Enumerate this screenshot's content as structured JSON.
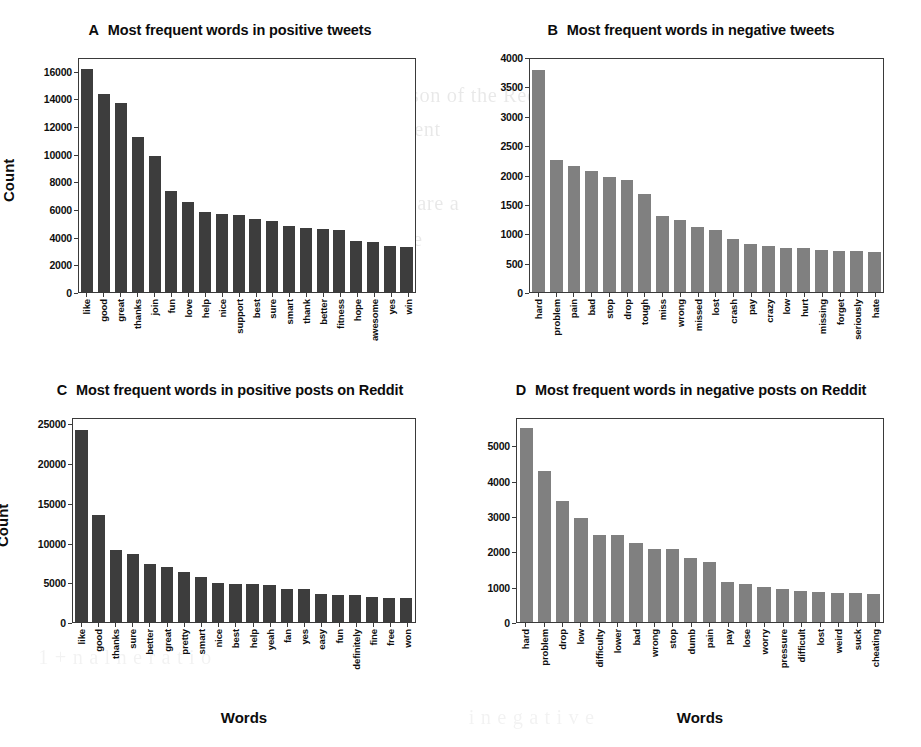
{
  "figure": {
    "ylabel": "Count",
    "xlabel": "Words",
    "bar_color_dark": "#3d3d3d",
    "bar_color_mid": "#808080",
    "axis_color": "#3a3a3a"
  },
  "bleed_lines": [
    "t  comparison of the  Reddit",
    "you lead to  a  very  different",
    "analysis  of  the  highest ranking",
    "on  the  Reddit  posts  are  a",
    "f  the  are  in  of  to  the"
  ],
  "chart_data": [
    {
      "panel": "A",
      "type": "bar",
      "letter": "A",
      "title": "Most frequent words in positive tweets",
      "xlabel": "",
      "ylabel": "Count",
      "ylim": [
        0,
        17000
      ],
      "yticks": [
        0,
        2000,
        4000,
        6000,
        8000,
        10000,
        12000,
        14000,
        16000
      ],
      "grid": false,
      "bar_color": "#3d3d3d",
      "categories": [
        "like",
        "good",
        "great",
        "thanks",
        "join",
        "fun",
        "love",
        "help",
        "nice",
        "support",
        "best",
        "sure",
        "smart",
        "thank",
        "better",
        "fitness",
        "hope",
        "awesome",
        "yes",
        "win"
      ],
      "values": [
        16300,
        14450,
        13800,
        11300,
        9900,
        7400,
        6600,
        5850,
        5700,
        5600,
        5300,
        5150,
        4850,
        4700,
        4600,
        4520,
        3750,
        3650,
        3350,
        3250
      ]
    },
    {
      "panel": "B",
      "type": "bar",
      "letter": "B",
      "title": "Most frequent words in negative tweets",
      "xlabel": "",
      "ylabel": "",
      "ylim": [
        0,
        4000
      ],
      "yticks": [
        0,
        500,
        1000,
        1500,
        2000,
        2500,
        3000,
        3500,
        4000
      ],
      "grid": false,
      "bar_color": "#808080",
      "categories": [
        "hard",
        "problem",
        "pain",
        "bad",
        "stop",
        "drop",
        "tough",
        "miss",
        "wrong",
        "missed",
        "lost",
        "crash",
        "pay",
        "crazy",
        "low",
        "hurt",
        "missing",
        "forget",
        "seriously",
        "hate"
      ],
      "values": [
        3820,
        2260,
        2170,
        2070,
        1980,
        1930,
        1690,
        1300,
        1230,
        1110,
        1060,
        910,
        820,
        790,
        760,
        750,
        720,
        710,
        700,
        690
      ]
    },
    {
      "panel": "C",
      "type": "bar",
      "letter": "C",
      "title": "Most frequent words in positive posts on Reddit",
      "xlabel": "Words",
      "ylabel": "Count",
      "ylim": [
        0,
        25800
      ],
      "yticks": [
        0,
        5000,
        10000,
        15000,
        20000,
        25000
      ],
      "grid": false,
      "bar_color": "#3d3d3d",
      "categories": [
        "like",
        "good",
        "thanks",
        "sure",
        "better",
        "great",
        "pretty",
        "smart",
        "nice",
        "best",
        "help",
        "yeah",
        "fan",
        "yes",
        "easy",
        "fun",
        "definitely",
        "fine",
        "free",
        "won"
      ],
      "values": [
        24400,
        13550,
        9150,
        8600,
        7350,
        6950,
        6400,
        5750,
        5000,
        4850,
        4800,
        4700,
        4250,
        4150,
        3550,
        3450,
        3400,
        3200,
        3100,
        3050
      ]
    },
    {
      "panel": "D",
      "type": "bar",
      "letter": "D",
      "title": "Most frequent words in negative posts on Reddit",
      "xlabel": "Words",
      "ylabel": "",
      "ylim": [
        0,
        5800
      ],
      "yticks": [
        0,
        1000,
        2000,
        3000,
        4000,
        5000
      ],
      "grid": false,
      "bar_color": "#808080",
      "categories": [
        "hard",
        "problem",
        "drop",
        "low",
        "difficulty",
        "lower",
        "bad",
        "wrong",
        "stop",
        "dumb",
        "pain",
        "pay",
        "lose",
        "worry",
        "pressure",
        "difficult",
        "lost",
        "weird",
        "suck",
        "cheating"
      ],
      "values": [
        5550,
        4320,
        3460,
        2970,
        2500,
        2480,
        2250,
        2090,
        2080,
        1830,
        1720,
        1140,
        1090,
        1000,
        950,
        880,
        870,
        840,
        830,
        810
      ]
    }
  ]
}
